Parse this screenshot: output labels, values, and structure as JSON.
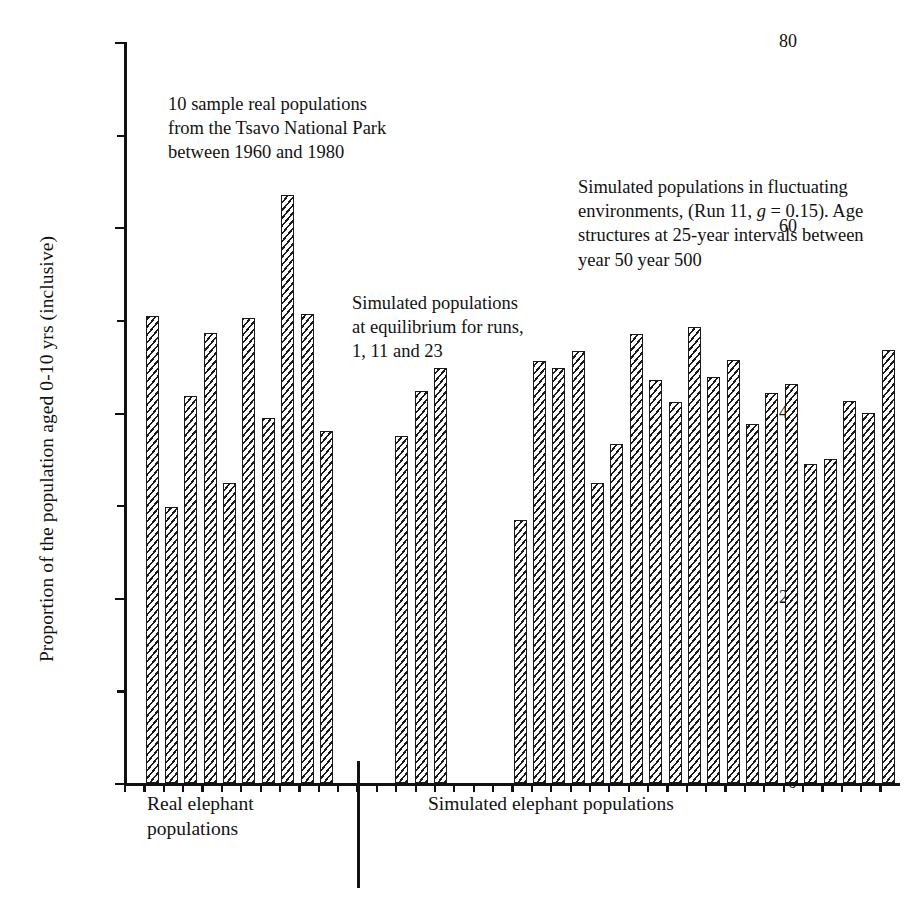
{
  "axes": {
    "ylabel": "Proportion of the population aged 0-10 yrs (inclusive)",
    "ytick_labels": [
      "0",
      "20",
      "40",
      "60",
      "80"
    ],
    "ymin": 0,
    "ymax": 80
  },
  "annotations": {
    "real": "10 sample real populations\nfrom the Tsavo National Park\nbetween 1960 and 1980",
    "equilibrium": "Simulated populations\nat equilibrium for runs,\n1, 11 and 23",
    "fluctuating_line1": "Simulated populations in fluctuating",
    "fluctuating_line2_a": "environments, (Run 11, ",
    "fluctuating_line2_g": "g",
    "fluctuating_line2_b": " = 0.15). Age",
    "fluctuating_line3": "structures at 25-year intervals between",
    "fluctuating_line4": "year 50 year 500"
  },
  "group_labels": {
    "real": "Real elephant\npopulations",
    "simulated": "Simulated elephant populations"
  },
  "colors": {
    "ink": "#111111",
    "background": "#ffffff",
    "bar_hatch": "#1a1a1a"
  },
  "chart_data": {
    "type": "bar",
    "title": "",
    "xlabel": "",
    "ylabel": "Proportion of the population aged 0-10 yrs (inclusive)",
    "ylim": [
      0,
      80
    ],
    "yticks_major": [
      0,
      20,
      40,
      60,
      80
    ],
    "yticks_minor": [
      10,
      30,
      50,
      70
    ],
    "grid": false,
    "legend": "none",
    "groups": [
      {
        "name": "Real elephant populations",
        "description": "10 sample real populations from the Tsavo National Park between 1960 and 1980",
        "categories": [
          "R1",
          "R2",
          "R3",
          "R4",
          "R5",
          "R6",
          "R7",
          "R8",
          "R9",
          "R10"
        ],
        "values": [
          50.4,
          29.8,
          41.8,
          48.6,
          32.4,
          50.2,
          39.4,
          63.5,
          50.6,
          38.0
        ]
      },
      {
        "name": "Simulated populations at equilibrium",
        "description": "Simulated populations at equilibrium for runs, 1, 11 and 23",
        "categories": [
          "Run 1",
          "Run 11",
          "Run 23"
        ],
        "values": [
          37.5,
          42.3,
          44.8
        ]
      },
      {
        "name": "Simulated populations in fluctuating environments",
        "description": "Simulated populations in fluctuating environments, (Run 11, g = 0.15). Age structures at 25-year intervals between year 50 year 500",
        "categories": [
          "50",
          "75",
          "100",
          "125",
          "150",
          "175",
          "200",
          "225",
          "250",
          "275",
          "300",
          "325",
          "350",
          "375",
          "400",
          "425",
          "450",
          "475",
          "500"
        ],
        "values": [
          28.4,
          45.6,
          44.8,
          46.6,
          32.4,
          36.6,
          48.5,
          43.5,
          41.1,
          49.2,
          43.8,
          45.7,
          38.8,
          42.1,
          43.1,
          34.4,
          35.0,
          41.2,
          39.9,
          46.7
        ]
      }
    ]
  }
}
